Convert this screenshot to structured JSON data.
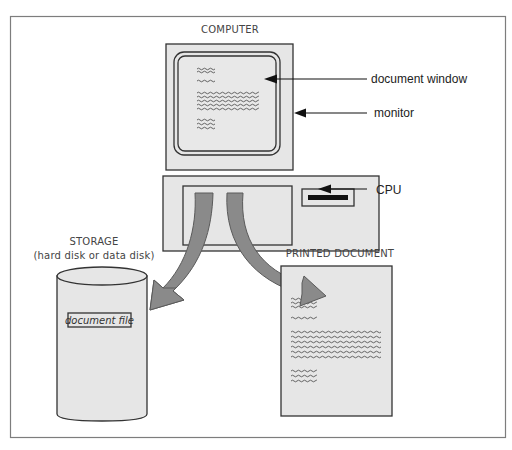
{
  "diagram": {
    "title_computer": "COMPUTER",
    "callouts": {
      "document_window": "document window",
      "monitor": "monitor",
      "cpu": "CPU"
    },
    "storage": {
      "title": "STORAGE",
      "subtitle": "(hard disk or data disk)",
      "file_label": "document file"
    },
    "printed": {
      "title": "PRINTED DOCUMENT"
    },
    "flows": [
      {
        "from": "CPU",
        "to": "STORAGE"
      },
      {
        "from": "CPU",
        "to": "PRINTED DOCUMENT"
      }
    ],
    "colors": {
      "fill_gray": "#e6e6e6",
      "arrow_gray": "#8a8a8a",
      "outline": "#333333",
      "frame": "#7d7d7d"
    }
  }
}
